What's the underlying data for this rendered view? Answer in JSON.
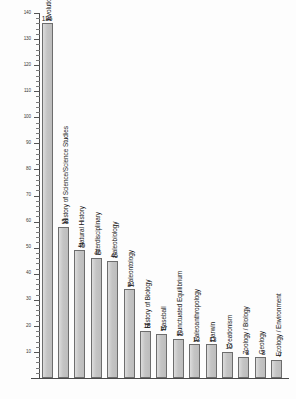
{
  "chart_data": {
    "type": "bar",
    "title": "",
    "subtitle": "",
    "xlabel": "",
    "ylabel": "",
    "ylim": [
      0,
      140
    ],
    "grid": false,
    "legend": null,
    "y_major_step": 10,
    "y_minor_step": 2,
    "y_tick_labels": [
      "140",
      "130",
      "120",
      "110",
      "100",
      "90",
      "80",
      "70",
      "60",
      "50",
      "40",
      "30",
      "20",
      "10"
    ],
    "y_tick_values": [
      140,
      130,
      120,
      110,
      100,
      90,
      80,
      70,
      60,
      50,
      40,
      30,
      20,
      10
    ],
    "categories": [
      "Evolutionary Theory",
      "History of Science/Science Studies",
      "Natural History",
      "Interdisciplinary",
      "Paleobiology",
      "Paleontology",
      "History of Biology",
      "Baseball",
      "Punctuated Equilibrium",
      "Paleoanthropology",
      "Darwin",
      "Creationism",
      "Zoology / Biology",
      "Geology",
      "Ecology / Environment"
    ],
    "values": [
      136,
      58,
      49,
      46,
      45,
      34,
      18,
      17,
      15,
      13,
      13,
      10,
      8,
      8,
      7
    ],
    "data_labels": [
      "136",
      "58",
      "49",
      "46",
      "45",
      "34",
      "18",
      "17",
      "15",
      "13",
      "13",
      "10",
      "8",
      "8",
      "7"
    ],
    "bar_color": "#c9c9c9",
    "bar_border_color": "#6d6d6d",
    "axis_color": "#4a4a4a",
    "text_color": "#1a1a1a",
    "background_color": "#ffffff"
  }
}
